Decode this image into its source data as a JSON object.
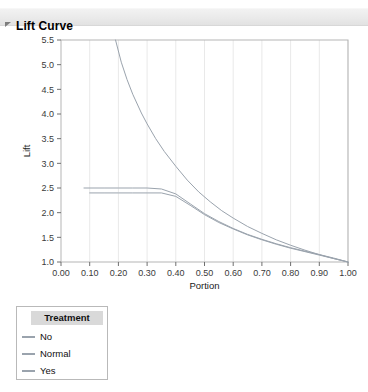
{
  "panel": {
    "title": "Lift Curve",
    "disclosure_icon": "triangle-collapse-icon"
  },
  "legend": {
    "title": "Treatment",
    "entries": [
      {
        "label": "No",
        "color": "#9aa3ad"
      },
      {
        "label": "Normal",
        "color": "#9aa3ad"
      },
      {
        "label": "Yes",
        "color": "#9aa3ad"
      }
    ]
  },
  "chart_data": {
    "type": "line",
    "title": "Lift Curve",
    "xlabel": "Portion",
    "ylabel": "Lift",
    "xlim": [
      0.0,
      1.0
    ],
    "ylim": [
      1.0,
      5.5
    ],
    "xticks": [
      "0.00",
      "0.10",
      "0.20",
      "0.30",
      "0.40",
      "0.50",
      "0.60",
      "0.70",
      "0.80",
      "0.90",
      "1.00"
    ],
    "xtick_values": [
      0.0,
      0.1,
      0.2,
      0.3,
      0.4,
      0.5,
      0.6,
      0.7,
      0.8,
      0.9,
      1.0
    ],
    "yticks": [
      "1.0",
      "1.5",
      "2.0",
      "2.5",
      "3.0",
      "3.5",
      "4.0",
      "4.5",
      "5.0",
      "5.5"
    ],
    "ytick_values": [
      1.0,
      1.5,
      2.0,
      2.5,
      3.0,
      3.5,
      4.0,
      4.5,
      5.0,
      5.5
    ],
    "grid": "vertical",
    "legend_position": "below-left",
    "legend_title": "Treatment",
    "series": [
      {
        "name": "No",
        "color": "#9aa3ad",
        "x": [
          0.08,
          0.15,
          0.2,
          0.25,
          0.3,
          0.35,
          0.4,
          0.45,
          0.5,
          0.55,
          0.6,
          0.65,
          0.7,
          0.75,
          0.8,
          0.85,
          0.9,
          0.95,
          1.0
        ],
        "y": [
          2.5,
          2.5,
          2.5,
          2.5,
          2.5,
          2.48,
          2.38,
          2.18,
          1.98,
          1.82,
          1.68,
          1.56,
          1.46,
          1.37,
          1.29,
          1.22,
          1.15,
          1.08,
          1.0
        ]
      },
      {
        "name": "Normal",
        "color": "#9aa3ad",
        "x": [
          0.1,
          0.15,
          0.2,
          0.25,
          0.3,
          0.35,
          0.4,
          0.45,
          0.5,
          0.55,
          0.6,
          0.65,
          0.7,
          0.75,
          0.8,
          0.85,
          0.9,
          0.95,
          1.0
        ],
        "y": [
          2.4,
          2.4,
          2.4,
          2.4,
          2.4,
          2.4,
          2.33,
          2.15,
          1.96,
          1.8,
          1.67,
          1.55,
          1.45,
          1.36,
          1.28,
          1.21,
          1.14,
          1.07,
          1.0
        ]
      },
      {
        "name": "Yes",
        "color": "#9aa3ad",
        "x": [
          0.19,
          0.21,
          0.23,
          0.25,
          0.28,
          0.3,
          0.33,
          0.36,
          0.4,
          0.44,
          0.48,
          0.52,
          0.56,
          0.6,
          0.65,
          0.7,
          0.75,
          0.8,
          0.85,
          0.9,
          0.95,
          1.0
        ],
        "y": [
          5.5,
          5.05,
          4.7,
          4.4,
          4.02,
          3.8,
          3.5,
          3.24,
          2.94,
          2.66,
          2.42,
          2.22,
          2.04,
          1.89,
          1.72,
          1.58,
          1.45,
          1.34,
          1.24,
          1.15,
          1.07,
          1.0
        ]
      }
    ]
  }
}
